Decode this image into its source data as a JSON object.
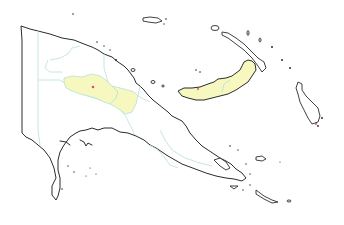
{
  "map": {
    "subject": "Papua New Guinea provinces",
    "colors": {
      "background": "#ffffff",
      "coastline": "#2b2b2b",
      "province_border": "#b8e0d8",
      "highlight_fill": "#f7f7c0",
      "marker": "#e05050"
    },
    "highlighted_regions": [
      {
        "name": "highlands-province-west"
      },
      {
        "name": "highlands-province-east"
      },
      {
        "name": "new-britain-island"
      }
    ],
    "markers": [
      {
        "name": "location-marker-highlands",
        "x": 93,
        "y": 87
      },
      {
        "name": "location-marker-new-britain",
        "x": 198,
        "y": 89
      },
      {
        "name": "location-marker-bougainville",
        "x": 316,
        "y": 124
      }
    ]
  }
}
